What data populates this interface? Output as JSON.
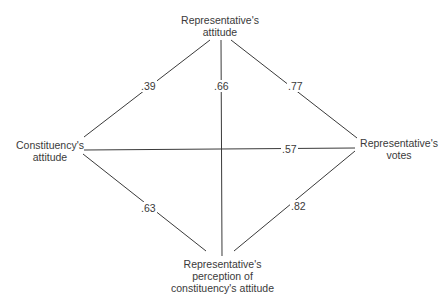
{
  "nodes": {
    "top": {
      "line1": "Representative's",
      "line2": "attitude"
    },
    "left": {
      "line1": "Constituency's",
      "line2": "attitude"
    },
    "right": {
      "line1": "Representative's",
      "line2": "votes"
    },
    "bottom": {
      "line1": "Representative's",
      "line2": "perception of",
      "line3": "constituency's attitude"
    }
  },
  "edges": [
    {
      "from": "Constituency's attitude",
      "to": "Representative's attitude",
      "value": ".39"
    },
    {
      "from": "Representative's attitude",
      "to": "Representative's perception of constituency's attitude",
      "value": ".66"
    },
    {
      "from": "Representative's attitude",
      "to": "Representative's votes",
      "value": ".77"
    },
    {
      "from": "Constituency's attitude",
      "to": "Representative's votes",
      "value": ".57"
    },
    {
      "from": "Constituency's attitude",
      "to": "Representative's perception of constituency's attitude",
      "value": ".63"
    },
    {
      "from": "Representative's perception of constituency's attitude",
      "to": "Representative's votes",
      "value": ".82"
    }
  ]
}
